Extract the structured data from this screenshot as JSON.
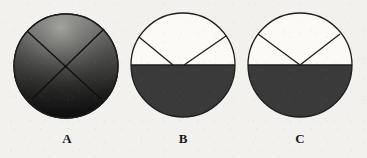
{
  "figure": {
    "background_color": "#f2f1ee",
    "ink_color": "#1c1c1c",
    "fill_gray": "#3a3a3a",
    "white_fill": "#fbfaf7",
    "stroke_width": 1.3,
    "caption_font_size": 13,
    "items": [
      {
        "id": "A",
        "label": "A",
        "label_x": 67,
        "label_y": 143,
        "center_x": 66,
        "center_y": 66,
        "radius": 52,
        "fill_type": "gradient",
        "gradient_top_color": "#8a8a88",
        "gradient_mid_color": "#4a4a48",
        "gradient_bottom_color": "#141414",
        "shaded_fraction": "1",
        "divider_type": "x-cross",
        "dividers": [
          {
            "name": "cross-line-1",
            "x1": 27,
            "y1": 31,
            "x2": 101,
            "y2": 99
          },
          {
            "name": "cross-line-2",
            "x1": 104,
            "y1": 29,
            "x2": 31,
            "y2": 100
          }
        ]
      },
      {
        "id": "B",
        "label": "B",
        "label_x": 183,
        "label_y": 143,
        "center_x": 183,
        "center_y": 65,
        "radius": 52,
        "fill_type": "half-bottom",
        "shaded_fraction": "1/2",
        "divider_type": "two-offset-chords",
        "dividers": [
          {
            "name": "chord-line-left",
            "x1": 139,
            "y1": 37,
            "x2": 173,
            "y2": 65
          },
          {
            "name": "chord-line-right",
            "x1": 226,
            "y1": 36,
            "x2": 184,
            "y2": 65
          },
          {
            "name": "diameter-line",
            "x1": 131,
            "y1": 65,
            "x2": 235,
            "y2": 65
          }
        ]
      },
      {
        "id": "C",
        "label": "C",
        "label_x": 300,
        "label_y": 143,
        "center_x": 300,
        "center_y": 65,
        "radius": 52,
        "fill_type": "half-bottom",
        "shaded_fraction": "1/2",
        "divider_type": "vee-at-center",
        "dividers": [
          {
            "name": "vee-line-left",
            "x1": 258,
            "y1": 34,
            "x2": 300,
            "y2": 65
          },
          {
            "name": "vee-line-right",
            "x1": 340,
            "y1": 34,
            "x2": 300,
            "y2": 65
          },
          {
            "name": "diameter-line",
            "x1": 248,
            "y1": 65,
            "x2": 352,
            "y2": 65
          }
        ]
      }
    ]
  }
}
